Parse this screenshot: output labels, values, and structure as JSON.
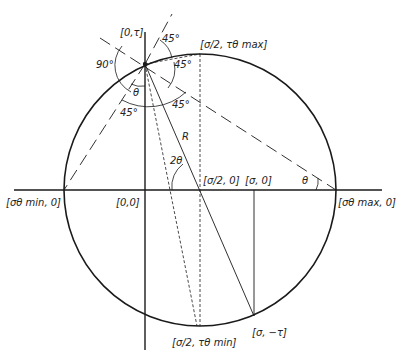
{
  "diagram": {
    "colors": {
      "ink": "#1a1a1a",
      "background": "#ffffff"
    },
    "points": {
      "origin": "[0,0]",
      "p_zero_tau": "[0,τ]",
      "p_top": "[σ/2, τθ max]",
      "p_bottom": "[σ/2, τθ min]",
      "p_center": "[σ/2, 0]",
      "p_sigma_zero": "[σ, 0]",
      "p_sigma_neg_tau": "[σ, −τ]",
      "p_left": "[σθ min, 0]",
      "p_right": "[σθ max, 0]"
    },
    "angles": {
      "a90": "90°",
      "a45_top": "45°",
      "a45_right_upper": "45°",
      "a45_right_lower": "45°",
      "a45_left": "45°",
      "theta_top": "θ",
      "theta_right": "θ",
      "two_theta": "2θ"
    },
    "radius_label": "R"
  }
}
